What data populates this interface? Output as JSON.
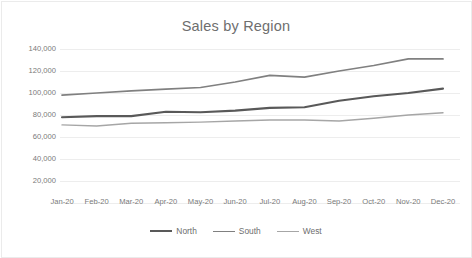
{
  "chart_data": {
    "type": "line",
    "title": "Sales by Region",
    "xlabel": "",
    "ylabel": "",
    "categories": [
      "Jan-20",
      "Feb-20",
      "Mar-20",
      "Apr-20",
      "May-20",
      "Jun-20",
      "Jul-20",
      "Aug-20",
      "Sep-20",
      "Oct-20",
      "Nov-20",
      "Dec-20"
    ],
    "series": [
      {
        "name": "North",
        "color": "#595959",
        "values": [
          78000,
          79000,
          79000,
          83000,
          82500,
          84000,
          86500,
          87000,
          93000,
          97000,
          100000,
          104000
        ]
      },
      {
        "name": "South",
        "color": "#808080",
        "values": [
          98000,
          100000,
          102000,
          103500,
          105000,
          110000,
          116000,
          114500,
          120000,
          125000,
          131000,
          131000
        ]
      },
      {
        "name": "West",
        "color": "#a6a6a6",
        "values": [
          71000,
          70000,
          72500,
          73000,
          73500,
          74500,
          75500,
          75500,
          74500,
          77000,
          80000,
          82000
        ]
      }
    ],
    "ylim": [
      0,
      140000
    ],
    "ytick_values": [
      140000,
      120000,
      100000,
      80000,
      60000,
      40000,
      20000
    ],
    "ytick_labels": [
      "140,000",
      "120,000",
      "100,000",
      "80,000",
      "60,000",
      "40,000",
      "20,000"
    ],
    "grid": true,
    "grid_color": "#ededed",
    "legend_position": "bottom",
    "legend_entries": [
      "North",
      "South",
      "West"
    ],
    "background_color": "#ffffff",
    "title_color": "#6e6e6e",
    "tick_label_color": "#7a7a7a"
  }
}
